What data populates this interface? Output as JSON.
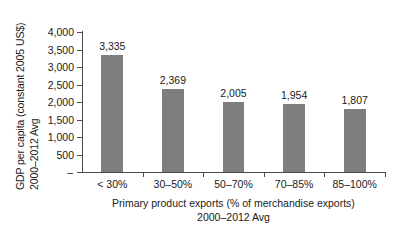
{
  "chart_data": {
    "type": "bar",
    "title": "",
    "subtitle": "",
    "categories": [
      "< 30%",
      "30–50%",
      "50–70%",
      "70–85%",
      "85–100%"
    ],
    "values": [
      3335,
      2369,
      2005,
      1954,
      1807
    ],
    "value_labels": [
      "3,335",
      "2,369",
      "2,005",
      "1,954",
      "1,807"
    ],
    "series": [
      {
        "name": "GDP per capita (constant 2005 US$) 2000–2012 Avg",
        "values": [
          3335,
          2369,
          2005,
          1954,
          1807
        ]
      }
    ],
    "ylabel_line1": "GDP per capita (constant 2005 US$)",
    "ylabel_line2": "2000–2012 Avg",
    "xlabel_line1": "Primary product exports (% of merchandise exports)",
    "xlabel_line2": "2000–2012 Avg",
    "ylim": [
      0,
      4000
    ],
    "ytick_values": [
      4000,
      3500,
      3000,
      2500,
      2000,
      1500,
      1000,
      500,
      0
    ],
    "ytick_labels": [
      "4,000",
      "3,500",
      "3,000",
      "2,500",
      "2,000",
      "1,500",
      "1,000",
      "500",
      "–"
    ],
    "grid": false,
    "legend": false,
    "legend_position": "none",
    "bar_color": "#7e7e7e",
    "axis_color": "#4d4d4d",
    "background_color": "#ffffff",
    "text_color": "#1a1a1a"
  }
}
